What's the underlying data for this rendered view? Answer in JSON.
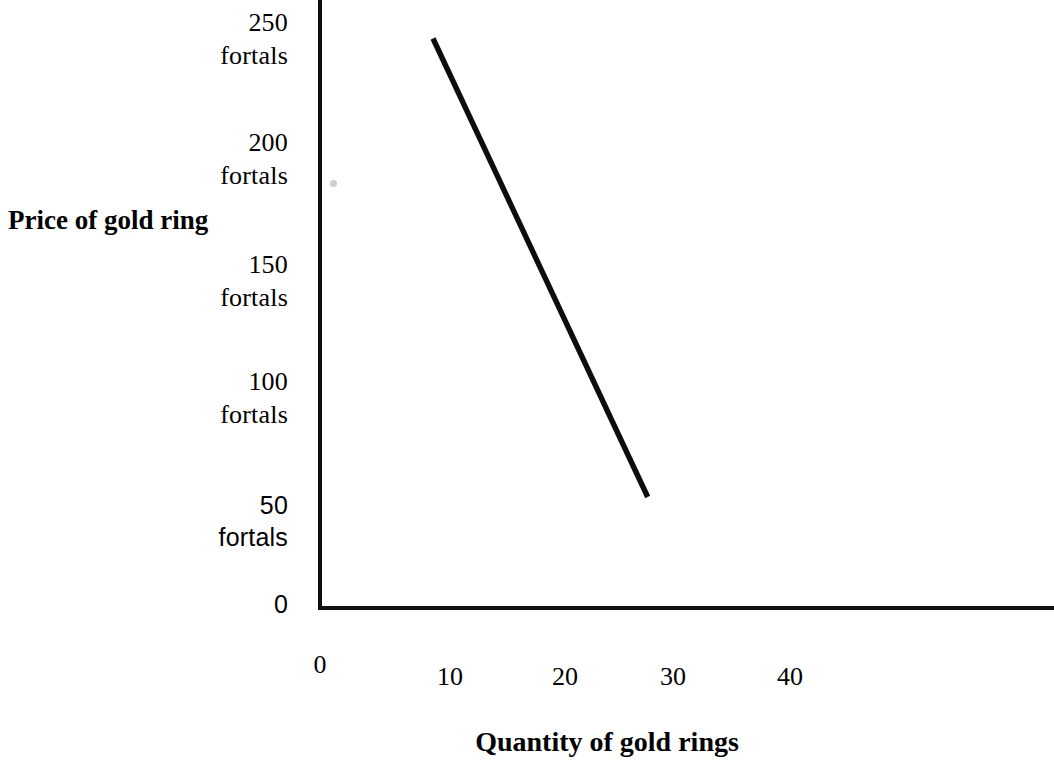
{
  "chart_data": {
    "type": "line",
    "title": "",
    "xlabel": "Quantity of gold rings",
    "ylabel": "Price of gold ring",
    "xlim": [
      0,
      65
    ],
    "ylim": [
      0,
      265
    ],
    "grid": false,
    "legend": null,
    "x_ticks": [
      "0",
      "10",
      "20",
      "30",
      "40"
    ],
    "x_tick_values": [
      0,
      10,
      20,
      30,
      40
    ],
    "y_ticks": [
      "0",
      "50 fortals",
      "100 fortals",
      "150 fortals",
      "200 fortals",
      "250 fortals"
    ],
    "y_tick_values": [
      0,
      50,
      100,
      150,
      200,
      250
    ],
    "y_unit": "fortals",
    "series": [
      {
        "name": "Demand",
        "x": [
          10,
          29
        ],
        "y": [
          250,
          48
        ]
      }
    ],
    "annotations": []
  },
  "axis_titles": {
    "y": "Price of gold ring",
    "x": "Quantity of gold rings"
  },
  "y_ticks": [
    {
      "id": "ytick-250",
      "num": "250",
      "unit": "fortals",
      "style": "serif"
    },
    {
      "id": "ytick-200",
      "num": "200",
      "unit": "fortals",
      "style": "serif"
    },
    {
      "id": "ytick-150",
      "num": "150",
      "unit": "fortals",
      "style": "serif"
    },
    {
      "id": "ytick-100",
      "num": "100",
      "unit": "fortals",
      "style": "serif"
    },
    {
      "id": "ytick-50",
      "num": "50",
      "unit": "fortals",
      "style": "sans"
    },
    {
      "id": "ytick-0",
      "num": "0",
      "unit": "",
      "style": "sans"
    }
  ],
  "x_ticks": [
    {
      "id": "xtick-0",
      "label": "0"
    },
    {
      "id": "xtick-10",
      "label": "10"
    },
    {
      "id": "xtick-20",
      "label": "20"
    },
    {
      "id": "xtick-30",
      "label": "30"
    },
    {
      "id": "xtick-40",
      "label": "40"
    }
  ],
  "colors": {
    "line": "#0d0d0d",
    "axis": "#101010",
    "background": "#ffffff",
    "speck": "#cfcfcf"
  }
}
